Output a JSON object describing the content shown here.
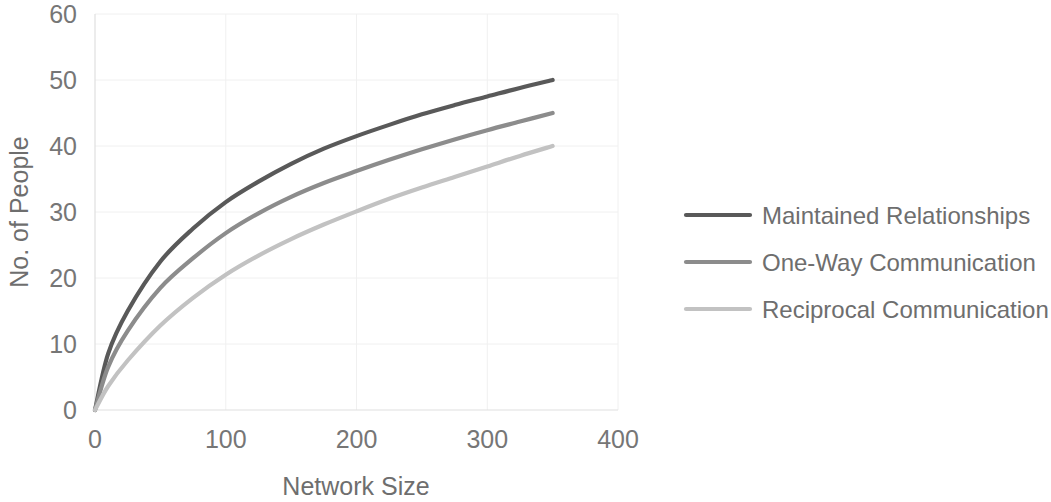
{
  "chart_data": {
    "type": "line",
    "title": "",
    "xlabel": "Network Size",
    "ylabel": "No. of People",
    "xlim": [
      0,
      400
    ],
    "ylim": [
      0,
      60
    ],
    "xticks": [
      0,
      100,
      200,
      300,
      400
    ],
    "yticks": [
      0,
      10,
      20,
      30,
      40,
      50,
      60
    ],
    "xtick_labels": [
      "0",
      "100",
      "200",
      "300",
      "400"
    ],
    "ytick_labels": [
      "0",
      "10",
      "20",
      "30",
      "40",
      "50",
      "60"
    ],
    "grid": "horizontal and vertical, very faint light gray",
    "legend_position": "right",
    "x": [
      0,
      10,
      25,
      50,
      75,
      100,
      125,
      150,
      175,
      200,
      225,
      250,
      275,
      300,
      325,
      350
    ],
    "series": [
      {
        "name": "Maintained Relationships",
        "color": "#595959",
        "values": [
          0,
          8.5,
          15.0,
          22.5,
          27.5,
          31.5,
          34.6,
          37.3,
          39.6,
          41.5,
          43.2,
          44.8,
          46.2,
          47.5,
          48.8,
          50.0
        ]
      },
      {
        "name": "One-Way Communication",
        "color": "#8c8c8c",
        "values": [
          0,
          6.5,
          12.0,
          18.5,
          23.0,
          26.8,
          29.8,
          32.3,
          34.4,
          36.2,
          37.9,
          39.5,
          41.0,
          42.4,
          43.7,
          45.0
        ]
      },
      {
        "name": "Reciprocal Communication",
        "color": "#c2c2c2",
        "values": [
          0,
          3.6,
          7.5,
          12.8,
          17.0,
          20.5,
          23.4,
          25.9,
          28.1,
          30.1,
          32.0,
          33.7,
          35.3,
          36.9,
          38.5,
          40.0
        ]
      }
    ]
  },
  "legend": {
    "items": [
      {
        "label": "Maintained Relationships",
        "color": "#595959"
      },
      {
        "label": "One-Way Communication",
        "color": "#8c8c8c"
      },
      {
        "label": "Reciprocal Communication",
        "color": "#c2c2c2"
      }
    ]
  },
  "axes": {
    "y_title": "No. of People",
    "x_title": "Network Size"
  },
  "colors": {
    "gridline": "#f0f0f0",
    "axisline": "#e0e0e0",
    "tick_text": "#767676",
    "background": "#ffffff"
  }
}
